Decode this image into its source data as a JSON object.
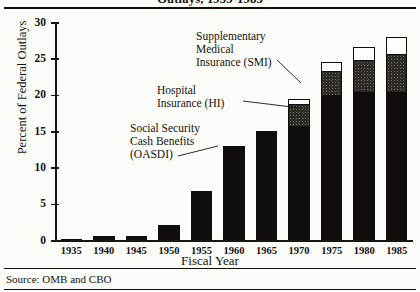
{
  "figure": {
    "title_clipped": "Outlays, 1935-1985",
    "source_note": "Source: OMB and CBO"
  },
  "chart_data": {
    "type": "bar",
    "stacked": true,
    "title": "Outlays, 1935-1985",
    "xlabel": "Fiscal Year",
    "ylabel": "Percent of Federal Outlays",
    "ylim": [
      0,
      30
    ],
    "yticks": [
      0,
      5,
      10,
      15,
      20,
      25,
      30
    ],
    "ytick_labels": [
      "0",
      "5",
      "10",
      "15",
      "20",
      "25",
      "30"
    ],
    "grid": false,
    "legend": "annotations",
    "categories": [
      "1935",
      "1940",
      "1945",
      "1950",
      "1955",
      "1960",
      "1965",
      "1970",
      "1975",
      "1980",
      "1985"
    ],
    "series": [
      {
        "name": "Social Security Cash Benefits (OASDI)",
        "key": "oasdi",
        "fill": "black",
        "values": [
          0.1,
          0.55,
          0.55,
          2.0,
          6.7,
          12.9,
          15.0,
          15.7,
          20.0,
          20.4,
          20.4
        ]
      },
      {
        "name": "Hospital Insurance (HI)",
        "key": "hi",
        "fill": "dark-stipple",
        "values": [
          0,
          0,
          0,
          0,
          0,
          0,
          0,
          2.9,
          3.1,
          4.3,
          5.0
        ]
      },
      {
        "name": "Supplementary Medical Insurance (SMI)",
        "key": "smi",
        "fill": "white",
        "values": [
          0,
          0,
          0,
          0,
          0,
          0,
          0,
          0.8,
          1.4,
          1.8,
          2.6
        ]
      }
    ],
    "totals": [
      0.1,
      0.55,
      0.55,
      2.0,
      6.7,
      12.9,
      15.0,
      19.4,
      24.5,
      26.5,
      28.0
    ],
    "annotations": [
      {
        "key": "smi",
        "lines": [
          "Supplementary",
          "Medical",
          "Insurance (SMI)"
        ]
      },
      {
        "key": "hi",
        "lines": [
          "Hospital",
          "Insurance (HI)"
        ]
      },
      {
        "key": "oasdi",
        "lines": [
          "Social Security",
          "Cash Benefits",
          "(OASDI)"
        ]
      }
    ],
    "colors": {
      "oasdi": "#100d0a",
      "hi": "#2d2a26",
      "smi": "#fdfdfb",
      "axis": "#17150f",
      "background": "#fbfbf8"
    }
  }
}
